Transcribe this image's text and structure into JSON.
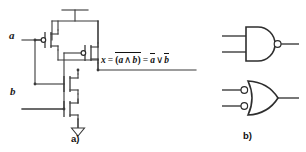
{
  "figure": {
    "background_color": "#ffffff",
    "line_color": "#3a3a3a",
    "text_color": "#111111"
  },
  "panel_a": {
    "caption": "a)",
    "description": "CMOS transistor-level NAND gate",
    "inputs": [
      {
        "name": "input-a",
        "label": "a"
      },
      {
        "name": "input-b",
        "label": "b"
      }
    ],
    "power_rail": {
      "name": "vdd-rail",
      "label": ""
    },
    "ground": {
      "name": "ground-symbol",
      "label": ""
    },
    "transistors": [
      {
        "name": "pmos-a",
        "type": "pmos",
        "gate_input": "a",
        "inverted_gate": true
      },
      {
        "name": "pmos-b",
        "type": "pmos",
        "gate_input": "b",
        "inverted_gate": true
      },
      {
        "name": "nmos-a",
        "type": "nmos",
        "gate_input": "a",
        "inverted_gate": false
      },
      {
        "name": "nmos-b",
        "type": "nmos",
        "gate_input": "b",
        "inverted_gate": false
      }
    ],
    "equation": {
      "output_var": "x",
      "equals": "=",
      "term1_open": "(",
      "term1_a": "a",
      "term1_op": "∧",
      "term1_b": "b",
      "term1_close": ")",
      "equals2": "=",
      "term2_a": "a",
      "term2_op": "∨",
      "term2_b": "b",
      "plain_text": "x = ¬(a ∧ b) = ā ∨ b̄"
    }
  },
  "panel_b": {
    "caption": "b)",
    "description": "Equivalent logic gate symbols",
    "gates": [
      {
        "name": "nand-gate-symbol",
        "type": "NAND",
        "shape": "and-body-with-output-bubble",
        "input_count": 2,
        "inverted_inputs": false,
        "inverted_output": true
      },
      {
        "name": "or-gate-inverted-inputs-symbol",
        "type": "OR",
        "shape": "or-body-with-input-bubbles",
        "input_count": 2,
        "inverted_inputs": true,
        "inverted_output": false
      }
    ]
  }
}
